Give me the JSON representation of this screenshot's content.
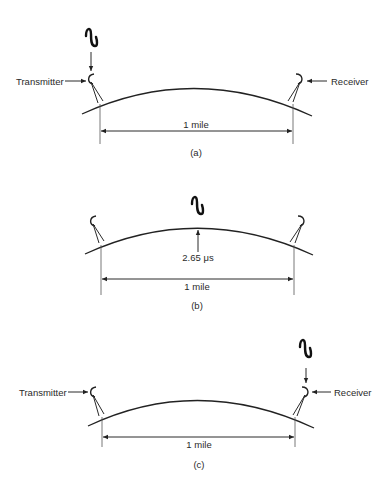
{
  "figure": {
    "panels": [
      {
        "id": "a",
        "caption": "(a)",
        "transmitter_label": "Transmitter",
        "receiver_label": "Receiver",
        "distance_label": "1 mile",
        "signal_position": "at transmitter"
      },
      {
        "id": "b",
        "caption": "(b)",
        "distance_label": "1 mile",
        "time_label": "2.65 μs",
        "signal_position": "midway over earth bulge"
      },
      {
        "id": "c",
        "caption": "(c)",
        "transmitter_label": "Transmitter",
        "receiver_label": "Receiver",
        "distance_label": "1 mile",
        "signal_position": "at receiver"
      }
    ]
  }
}
